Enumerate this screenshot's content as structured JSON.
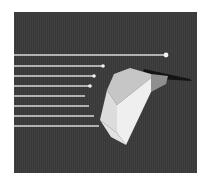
{
  "figure": {
    "title": "",
    "kind": "3d-raytrace-render",
    "canvas": {
      "width": 209,
      "height": 182
    },
    "page_background": "#ffffff"
  },
  "scene": {
    "name": "parallel-rays-on-faceted-wedge",
    "frame": {
      "x": 14,
      "y": 12,
      "width": 183,
      "height": 161
    },
    "background_color": "#3a3a3a",
    "texture": "vertical-scanlines"
  },
  "palette": {
    "backdrop": "#3a3a3a",
    "ray": "#d9d9d9",
    "ray_highlight": "#f2f2f2",
    "facet_top": "#cfcfcf",
    "facet_left": "#e6e6e6",
    "facet_front": "#f0f0f0",
    "facet_right_dark": "#9a9a9a",
    "shadow_wedge": "#141414",
    "frame_border": "#ffffff"
  },
  "rays": {
    "label": "parallel incident rays",
    "count": 8,
    "color": "#d9d9d9",
    "thickness": 1.6,
    "origin_x": 0,
    "items": [
      {
        "id": "ray-1",
        "y": 43,
        "x_start": 0,
        "x_end": 152,
        "terminator": "dot",
        "dot_radius": 2.4
      },
      {
        "id": "ray-2",
        "y": 54,
        "x_start": 0,
        "x_end": 89,
        "terminator": "dot",
        "dot_radius": 1.8
      },
      {
        "id": "ray-3",
        "y": 64,
        "x_start": 0,
        "x_end": 80,
        "terminator": "dot",
        "dot_radius": 1.8
      },
      {
        "id": "ray-4",
        "y": 74,
        "x_start": 0,
        "x_end": 76,
        "terminator": "dot",
        "dot_radius": 1.8
      },
      {
        "id": "ray-5",
        "y": 84,
        "x_start": 0,
        "x_end": 71,
        "terminator": "none",
        "dot_radius": 0
      },
      {
        "id": "ray-6",
        "y": 94,
        "x_start": 0,
        "x_end": 75,
        "terminator": "none",
        "dot_radius": 0
      },
      {
        "id": "ray-7",
        "y": 104,
        "x_start": 0,
        "x_end": 80,
        "terminator": "none",
        "dot_radius": 0
      },
      {
        "id": "ray-8",
        "y": 114,
        "x_start": 0,
        "x_end": 85,
        "terminator": "none",
        "dot_radius": 0
      }
    ]
  },
  "object": {
    "label": "faceted wedge solid",
    "facets": [
      {
        "id": "facet-top",
        "name": "top-facet",
        "fill": "#c6c6c6",
        "points": "93,78 100,62 116,56 137,62 137,66 103,93"
      },
      {
        "id": "facet-right",
        "name": "right-facet-shaded",
        "fill": "#8f8f8f",
        "points": "137,62 154,64 152,72 137,80"
      },
      {
        "id": "facet-left",
        "name": "left-facet",
        "fill": "#dcdcdc",
        "points": "93,78 103,93 103,121 86,108"
      },
      {
        "id": "facet-front",
        "name": "front-facet-bright",
        "fill": "#efefef",
        "points": "103,93 137,66 137,80 112,133 103,121"
      },
      {
        "id": "facet-lower",
        "name": "lower-front-facet",
        "fill": "#e2e2e2",
        "points": "86,108 103,121 112,133 97,125"
      }
    ]
  },
  "shadow": {
    "label": "cast shadow wedge",
    "fill": "#141414",
    "points": "130,57 176,67 178,69 128,66"
  },
  "annotations": []
}
